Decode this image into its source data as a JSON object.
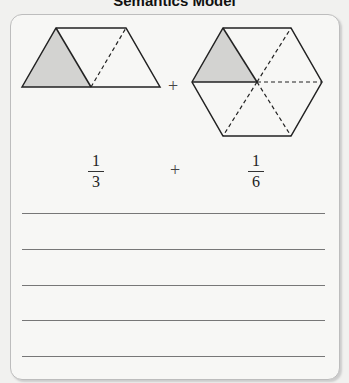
{
  "title": "Semantics Model",
  "figures": {
    "left": {
      "shape": "trapezoid",
      "parts": 3,
      "shaded": 1
    },
    "right": {
      "shape": "hexagon",
      "parts": 6,
      "shaded": 1
    }
  },
  "operator_top": "+",
  "equation": {
    "left": {
      "numerator": "1",
      "denominator": "3"
    },
    "operator": "+",
    "right": {
      "numerator": "1",
      "denominator": "6"
    }
  },
  "answer_lines": 5,
  "colors": {
    "shade": "#d3d3d1",
    "stroke": "#222222"
  }
}
